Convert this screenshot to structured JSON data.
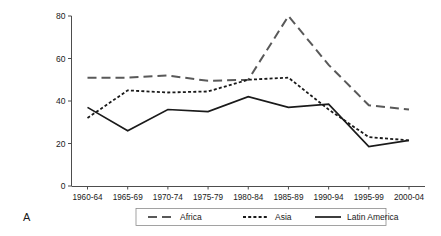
{
  "panel": {
    "label": "A"
  },
  "chart_data": {
    "type": "line",
    "title": "",
    "xlabel": "",
    "ylabel": "",
    "categories": [
      "1960-64",
      "1965-69",
      "1970-74",
      "1975-79",
      "1980-84",
      "1985-89",
      "1990-94",
      "1995-99",
      "2000-04"
    ],
    "ylim": [
      0,
      80
    ],
    "yticks": [
      0,
      20,
      40,
      60,
      80
    ],
    "ytick_labels": [
      "0",
      "20",
      "40",
      "60",
      "80"
    ],
    "grid": false,
    "legend_position": "bottom",
    "series": [
      {
        "name": "Africa",
        "style": "long-dash",
        "color": "#595959",
        "values": [
          51,
          51,
          52,
          49.5,
          50,
          80,
          57,
          38,
          36
        ]
      },
      {
        "name": "Asia",
        "style": "dotted",
        "color": "#1a1a1a",
        "values": [
          32,
          45,
          44,
          44.5,
          50,
          51,
          36,
          23,
          21.5
        ]
      },
      {
        "name": "Latin America",
        "style": "solid",
        "color": "#1a1a1a",
        "values": [
          37,
          26,
          36,
          35,
          42,
          37,
          38.5,
          18.5,
          21.5
        ]
      }
    ]
  }
}
